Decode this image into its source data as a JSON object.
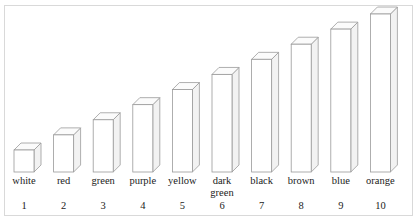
{
  "figure": {
    "background_color": "#ffffff",
    "frame_color": "#d9d9d9",
    "bar_outline_color": "#9a9a9a",
    "bar_fill_color": "#ffffff"
  },
  "chart_data": {
    "type": "bar",
    "title": "",
    "subtitle": "",
    "xlabel": "",
    "ylabel": "",
    "grid": false,
    "legend": null,
    "style": "3d-isometric-outline-bars",
    "ylim": [
      0,
      10
    ],
    "categories": [
      "white",
      "red",
      "green",
      "purple",
      "yellow",
      "dark green",
      "black",
      "brown",
      "blue",
      "orange"
    ],
    "tick_labels": [
      "1",
      "2",
      "3",
      "4",
      "5",
      "6",
      "7",
      "8",
      "9",
      "10"
    ],
    "values": [
      1,
      2,
      3,
      4,
      5,
      6,
      7,
      8,
      9,
      10
    ],
    "bars": [
      {
        "index": "1",
        "label": "white",
        "label_line1": "white",
        "label_line2": "",
        "value": 1
      },
      {
        "index": "2",
        "label": "red",
        "label_line1": "red",
        "label_line2": "",
        "value": 2
      },
      {
        "index": "3",
        "label": "green",
        "label_line1": "green",
        "label_line2": "",
        "value": 3
      },
      {
        "index": "4",
        "label": "purple",
        "label_line1": "purple",
        "label_line2": "",
        "value": 4
      },
      {
        "index": "5",
        "label": "yellow",
        "label_line1": "yellow",
        "label_line2": "",
        "value": 5
      },
      {
        "index": "6",
        "label": "dark green",
        "label_line1": "dark",
        "label_line2": "green",
        "value": 6
      },
      {
        "index": "7",
        "label": "black",
        "label_line1": "black",
        "label_line2": "",
        "value": 7
      },
      {
        "index": "8",
        "label": "brown",
        "label_line1": "brown",
        "label_line2": "",
        "value": 8
      },
      {
        "index": "9",
        "label": "blue",
        "label_line1": "blue",
        "label_line2": "",
        "value": 9
      },
      {
        "index": "10",
        "label": "orange",
        "label_line1": "orange",
        "label_line2": "",
        "value": 10
      }
    ]
  }
}
